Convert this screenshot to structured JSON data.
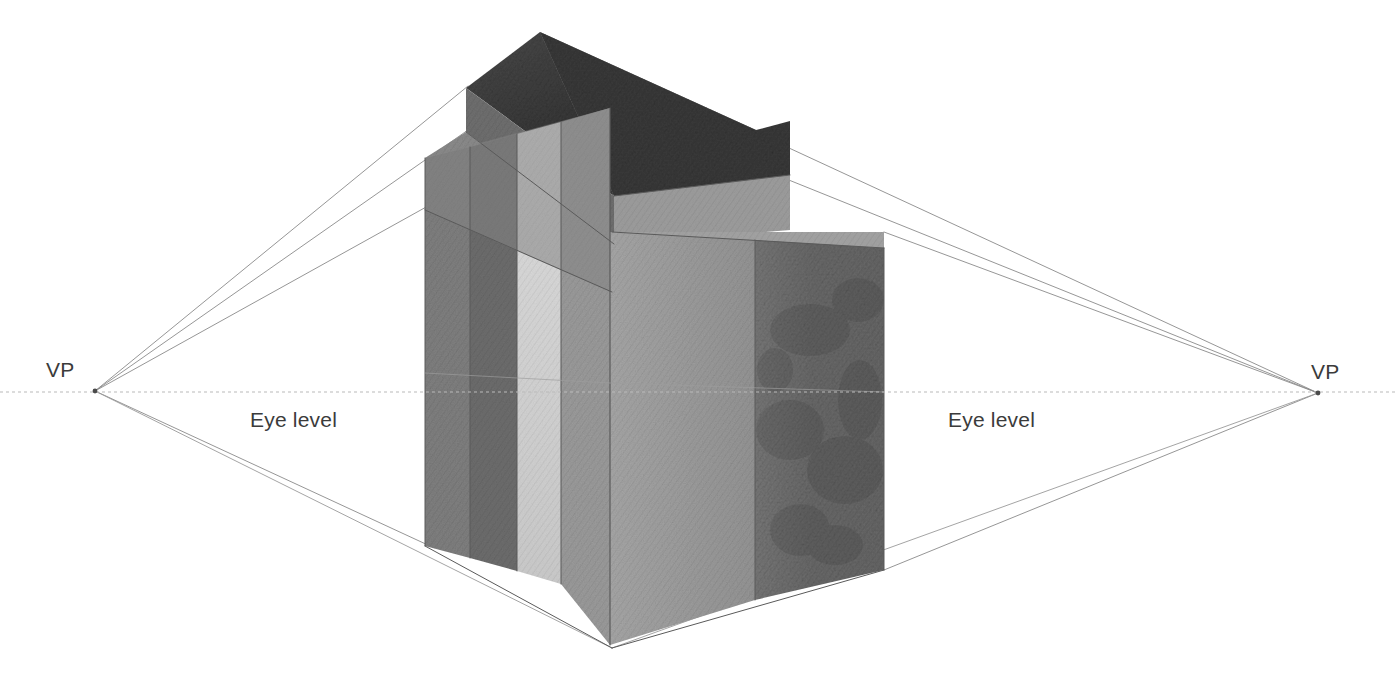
{
  "figure": {
    "type": "two-point-perspective-construction-drawing",
    "medium": "graphite pencil rendering",
    "background_color": "#ffffff"
  },
  "labels": {
    "vp_left": "VP",
    "vp_right": "VP",
    "eye_level_left": "Eye level",
    "eye_level_right": "Eye level"
  },
  "geometry": {
    "canvas": {
      "width": 1397,
      "height": 700
    },
    "vanishing_points": {
      "left": {
        "x": 95,
        "y": 391
      },
      "right": {
        "x": 1318,
        "y": 393
      }
    },
    "horizon_line": {
      "name": "eye-level-line",
      "y": 392,
      "x_start": 0,
      "x_end": 1397,
      "style": "dotted",
      "color": "#b9b9b9"
    },
    "building": {
      "front_corner_x": 610,
      "top_corner_y": 108,
      "bottom_corner_y": 645,
      "left_face_outer_x": 425,
      "right_face_outer_x": 885,
      "left_face_top_y": 155,
      "left_face_bottom_y": 545,
      "right_face_top_y": 232,
      "right_face_bottom_y": 570,
      "roof_top_corner": {
        "x": 540,
        "y": 32
      },
      "roof_left_outer_x": 466,
      "roof_right_outer_x": 790
    },
    "construction_lines_left_vp": [
      {
        "name": "roof-upper-edge",
        "from_x": 466,
        "from_y": 86
      },
      {
        "name": "roof-lower-edge",
        "from_x": 466,
        "from_y": 132
      },
      {
        "name": "parapet-base-edge",
        "from_x": 425,
        "from_y": 206
      },
      {
        "name": "base-edge",
        "from_x": 425,
        "from_y": 545
      }
    ],
    "construction_lines_right_vp": [
      {
        "name": "roof-upper-edge",
        "from_x": 790,
        "from_y": 121
      },
      {
        "name": "roof-lower-edge",
        "from_x": 790,
        "from_y": 155
      },
      {
        "name": "parapet-base-edge",
        "from_x": 885,
        "from_y": 232
      },
      {
        "name": "base-edge",
        "from_x": 885,
        "from_y": 570
      }
    ]
  },
  "palette": {
    "roof_top_dark": "#3c3c3c",
    "roof_face_mid": "#6f6f6f",
    "roof_face_light": "#949494",
    "parapet_band": "#8d8d8d",
    "left_panel_a": "#7e7e7e",
    "left_panel_b": "#6f6f6f",
    "left_panel_light": "#d2d2d2",
    "left_panel_c": "#9a9a9a",
    "right_face_mid": "#9d9d9d",
    "right_face_dark": "#6b6b6b",
    "line_color": "#7a7a7a",
    "horizon_color": "#b9b9b9",
    "text_color": "#3b3b3b"
  },
  "panels": {
    "left_face": [
      {
        "name": "panel-1",
        "tone": "#7e7e7e"
      },
      {
        "name": "panel-2",
        "tone": "#6e6e6e"
      },
      {
        "name": "panel-3",
        "tone": "#d2d2d2"
      },
      {
        "name": "panel-4",
        "tone": "#9b9b9b"
      }
    ],
    "right_face": [
      {
        "name": "panel-5",
        "tone": "#9d9d9d"
      },
      {
        "name": "panel-6",
        "tone": "#6b6b6b"
      }
    ]
  }
}
